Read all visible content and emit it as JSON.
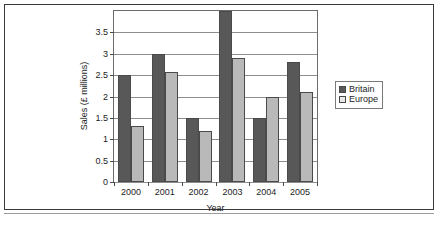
{
  "chart_data": {
    "type": "bar",
    "title": "",
    "xlabel": "Year",
    "ylabel": "Sales (£ millions)",
    "categories": [
      "2000",
      "2001",
      "2002",
      "2003",
      "2004",
      "2005"
    ],
    "series": [
      {
        "name": "Britain",
        "color": "#585858",
        "values": [
          2.5,
          3.0,
          1.5,
          4.0,
          1.5,
          2.8
        ]
      },
      {
        "name": "Europe",
        "color": "#b9b9b9",
        "values": [
          1.3,
          2.58,
          1.2,
          2.9,
          2.0,
          2.1
        ]
      }
    ],
    "ylim": [
      0,
      4
    ],
    "yticks": [
      0,
      0.5,
      1,
      1.5,
      2,
      2.5,
      3,
      3.5
    ],
    "ytick_labels": [
      "0",
      "0.5",
      "1",
      "1.5",
      "2",
      "2.5",
      "3",
      "3.5"
    ],
    "grid": true,
    "legend_position": "right"
  },
  "legend": {
    "entries": [
      {
        "label": "Britain"
      },
      {
        "label": "Europe"
      }
    ]
  },
  "axes": {
    "x_title": "Year",
    "y_title": "Sales (£ millions)"
  }
}
